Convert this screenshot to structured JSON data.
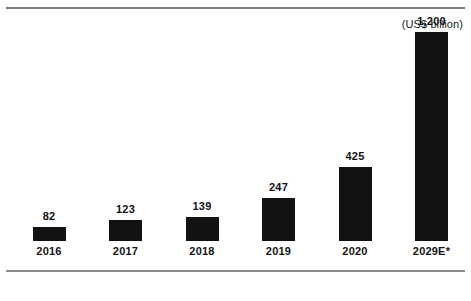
{
  "chart_data": {
    "type": "bar",
    "title": "",
    "subtitle": "",
    "unit_label": "(US$ billion)",
    "xlabel": "",
    "ylabel": "",
    "categories": [
      "2016",
      "2017",
      "2018",
      "2019",
      "2020",
      "2029E*"
    ],
    "values": [
      82,
      123,
      139,
      247,
      425,
      1200
    ],
    "value_labels": [
      "82",
      "123",
      "139",
      "247",
      "425",
      "1,200"
    ],
    "ylim": [
      0,
      1200
    ],
    "grid": false,
    "legend": null,
    "legend_position": "none",
    "bar_color": "#121212",
    "axis_color": "#8a8a8a",
    "rule_color": "#7d7d7d",
    "background": "#ffffff"
  },
  "chart": {
    "unit_label": "(US$ billion)",
    "bars": [
      {
        "category": "2016",
        "value_label": "82",
        "value": 82
      },
      {
        "category": "2017",
        "value_label": "123",
        "value": 123
      },
      {
        "category": "2018",
        "value_label": "139",
        "value": 139
      },
      {
        "category": "2019",
        "value_label": "247",
        "value": 247
      },
      {
        "category": "2020",
        "value_label": "425",
        "value": 425
      },
      {
        "category": "2029E*",
        "value_label": "1,200",
        "value": 1200
      }
    ]
  }
}
